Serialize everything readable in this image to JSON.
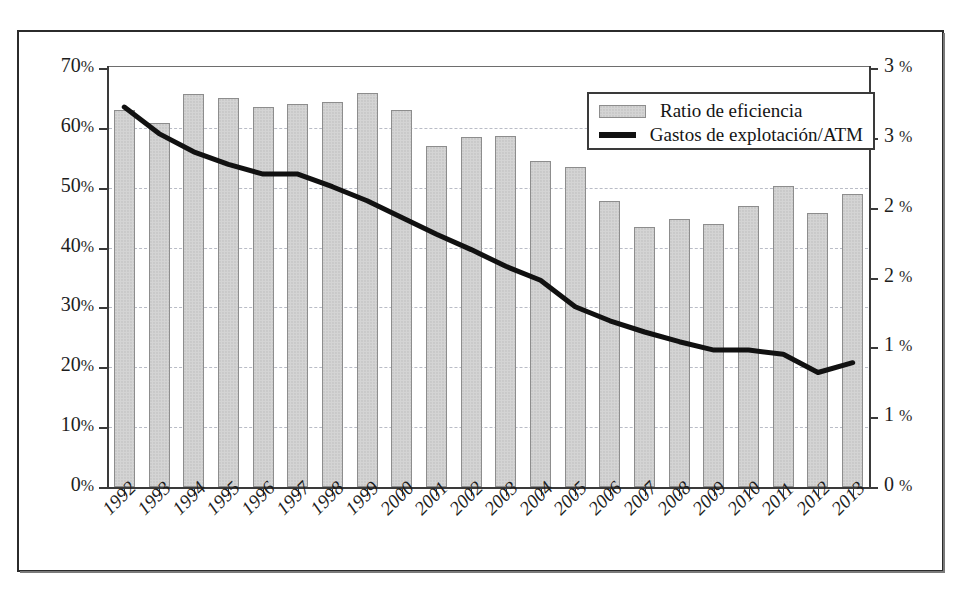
{
  "chart_data": {
    "type": "bar",
    "title": "",
    "subtitle": "",
    "xlabel": "",
    "ylabel": "",
    "grid": true,
    "legend_position": "top-right",
    "categories": [
      "1992",
      "1993",
      "1994",
      "1995",
      "1996",
      "1997",
      "1998",
      "1999",
      "2000",
      "2001",
      "2002",
      "2003",
      "2004",
      "2005",
      "2006",
      "2007",
      "2008",
      "2009",
      "2010",
      "2011",
      "2012",
      "2013"
    ],
    "axes": {
      "left": {
        "label": "",
        "ylim": [
          0,
          70
        ],
        "tick_values": [
          0,
          10,
          20,
          30,
          40,
          50,
          60,
          70
        ],
        "tick_labels": [
          "0%",
          "10%",
          "20%",
          "30%",
          "40%",
          "50%",
          "60%",
          "70%"
        ],
        "unit": "%"
      },
      "right": {
        "label": "",
        "ylim": [
          0,
          3
        ],
        "tick_values": [
          0,
          0.5,
          1.0,
          1.5,
          2.0,
          2.5,
          3.0
        ],
        "tick_labels": [
          "0%",
          "1%",
          "1%",
          "2%",
          "2%",
          "3%",
          "3%"
        ],
        "unit": "%"
      }
    },
    "series": [
      {
        "name": "Ratio de eficiencia",
        "type": "bar",
        "axis": "left",
        "color": "#d4d4d4",
        "edge_color": "#8d8d8d",
        "values": [
          62.9,
          60.8,
          65.6,
          65.0,
          63.5,
          64.0,
          64.4,
          65.8,
          63.0,
          57.0,
          58.5,
          58.7,
          54.5,
          53.5,
          47.8,
          43.5,
          44.8,
          44.0,
          47.0,
          50.3,
          45.8,
          49.0
        ]
      },
      {
        "name": "Gastos de explotación/ATM",
        "type": "line",
        "axis": "right",
        "color": "#111111",
        "values": [
          2.72,
          2.53,
          2.4,
          2.31,
          2.24,
          2.24,
          2.15,
          2.05,
          1.93,
          1.81,
          1.7,
          1.58,
          1.48,
          1.29,
          1.19,
          1.11,
          1.04,
          0.98,
          0.98,
          0.95,
          0.82,
          0.89
        ]
      }
    ]
  },
  "legend": {
    "items": [
      {
        "label": "Ratio de eficiencia",
        "marker": "bar-swatch"
      },
      {
        "label": "Gastos de explotación/ATM",
        "marker": "line-swatch"
      }
    ]
  }
}
